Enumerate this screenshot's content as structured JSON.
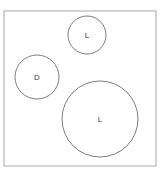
{
  "canvas": {
    "width": 163,
    "height": 175,
    "background_color": "#ffffff"
  },
  "frame": {
    "name": "bounding-box",
    "x": 4,
    "y": 11,
    "width": 152,
    "height": 155,
    "stroke_color": "#a9a9a9",
    "fill_color": "#ffffff",
    "stroke_width": 1
  },
  "shapes": [
    {
      "label": "L",
      "cx": 87,
      "cy": 35,
      "r": 19,
      "size": "small",
      "stroke_color": "#6e6e6e"
    },
    {
      "label": "D",
      "cx": 37,
      "cy": 77,
      "r": 22,
      "size": "medium",
      "stroke_color": "#6e6e6e"
    },
    {
      "label": "L",
      "cx": 100,
      "cy": 119,
      "r": 38,
      "size": "large",
      "stroke_color": "#6e6e6e"
    }
  ],
  "label_style": {
    "color": "#3b3b3b",
    "font_size": 8
  }
}
